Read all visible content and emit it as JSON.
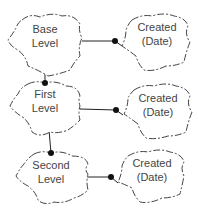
{
  "diagram": {
    "nodes": [
      {
        "id": "base",
        "line1": "Base",
        "line2": "Level"
      },
      {
        "id": "created1",
        "line1": "Created",
        "line2": "(Date)"
      },
      {
        "id": "first",
        "line1": "First",
        "line2": "Level"
      },
      {
        "id": "created2",
        "line1": "Created",
        "line2": "(Date)"
      },
      {
        "id": "second",
        "line1": "Second",
        "line2": "Level"
      },
      {
        "id": "created3",
        "line1": "Created",
        "line2": "(Date)"
      }
    ],
    "edges": [
      {
        "from": "base",
        "to": "created1"
      },
      {
        "from": "base",
        "to": "first"
      },
      {
        "from": "first",
        "to": "created2"
      },
      {
        "from": "first",
        "to": "second"
      },
      {
        "from": "second",
        "to": "created3"
      }
    ],
    "colors": {
      "stroke": "#444444",
      "dot": "#111111",
      "text": "#444444",
      "background": "#ffffff"
    }
  }
}
